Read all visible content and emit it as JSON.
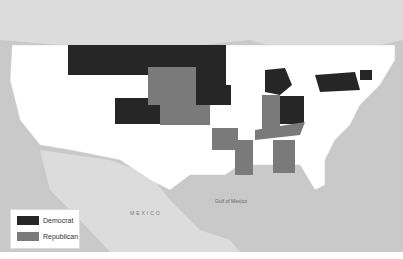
{
  "map": {
    "colors": {
      "democrat": "#262626",
      "republican": "#7a7a7a",
      "none": "#ffffff",
      "water": "#c9c9c9",
      "land_foreign": "#dcdcdc"
    },
    "states": {
      "democrat": [
        "Montana",
        "North Dakota",
        "Minnesota",
        "Iowa",
        "Colorado",
        "Michigan",
        "Ohio",
        "New York",
        "Massachusetts",
        "Connecticut"
      ],
      "republican": [
        "South Dakota",
        "Nebraska",
        "Kansas",
        "Indiana",
        "Kentucky",
        "Arkansas",
        "Mississippi",
        "Georgia"
      ]
    },
    "labels": {
      "mexico": "MEXICO",
      "gulf": "Gulf of Mexico"
    }
  },
  "legend": {
    "items": [
      {
        "label": "Democrat",
        "color": "#262626"
      },
      {
        "label": "Republican",
        "color": "#7a7a7a"
      }
    ]
  }
}
